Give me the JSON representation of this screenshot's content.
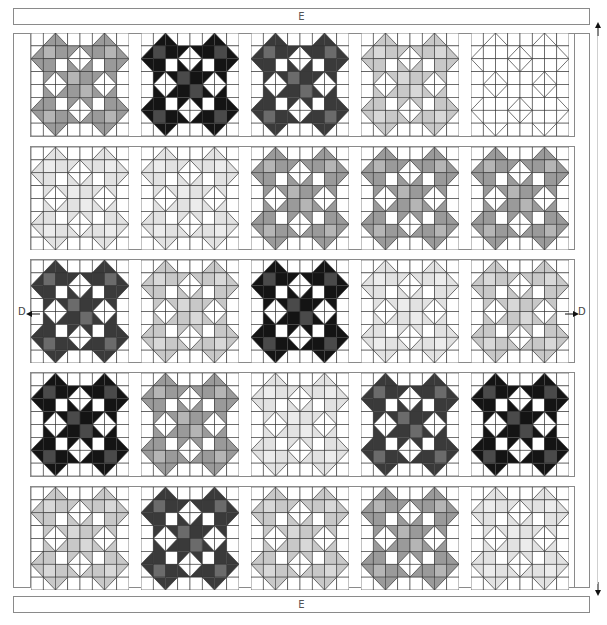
{
  "labels": {
    "top_border": "E",
    "bottom_border": "E",
    "left_side": "D",
    "right_side": "D"
  },
  "diagram": {
    "type": "quilt-layout",
    "block_pattern": "sawtooth-star-with-diamonds",
    "grid": {
      "rows": 5,
      "cols": 5,
      "cells_per_block": 8
    },
    "palettes": {
      "black": {
        "a": "#141414",
        "b": "#4a4a4a"
      },
      "dark": {
        "a": "#3a3a3a",
        "b": "#6b6b6b"
      },
      "mid": {
        "a": "#9a9a9a",
        "b": "#b5b5b5"
      },
      "light": {
        "a": "#c8c8c8",
        "b": "#d8d8d8"
      },
      "pale": {
        "a": "#e2e2e2",
        "b": "#ececec"
      },
      "white": {
        "a": "#ffffff",
        "b": "#ffffff"
      }
    },
    "layout": [
      [
        "mid",
        "black",
        "dark",
        "light",
        "white"
      ],
      [
        "pale",
        "pale",
        "mid",
        "mid",
        "mid"
      ],
      [
        "dark",
        "light",
        "black",
        "pale",
        "light"
      ],
      [
        "black",
        "mid",
        "pale",
        "dark",
        "black"
      ],
      [
        "light",
        "dark",
        "light",
        "mid",
        "pale"
      ]
    ]
  }
}
